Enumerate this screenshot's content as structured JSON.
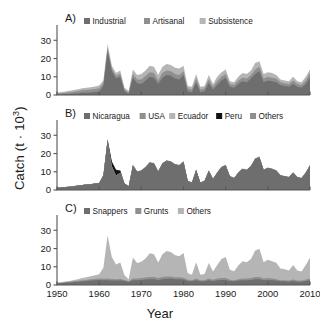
{
  "figure": {
    "axis_y_title": "Catch (t · 10",
    "axis_y_title_sup": "3",
    "axis_y_title_close": ")",
    "axis_x_title": "Year"
  },
  "colors": {
    "series_dark": "#6e6e6e",
    "series_mid": "#8f8f8f",
    "series_light": "#b5b5b5",
    "series_black": "#111111",
    "axis": "#555555",
    "background": "#ffffff",
    "text": "#1a1a1a"
  },
  "chart_data": [
    {
      "type": "area",
      "stacked": true,
      "panel": "A)",
      "title": "",
      "xlabel": "Year",
      "ylabel": "Catch (t · 10^3)",
      "xlim": [
        1950,
        2010
      ],
      "ylim": [
        0,
        34
      ],
      "xticks": [
        1950,
        1960,
        1970,
        1980,
        1990,
        2000,
        2010
      ],
      "yticks": [
        0,
        10,
        20,
        30
      ],
      "grid": false,
      "legend_position": "top",
      "legend": [
        "Industrial",
        "Artisanal",
        "Subsistence"
      ],
      "x": [
        1950,
        1951,
        1952,
        1953,
        1954,
        1955,
        1956,
        1957,
        1958,
        1959,
        1960,
        1961,
        1962,
        1963,
        1964,
        1965,
        1966,
        1967,
        1968,
        1969,
        1970,
        1971,
        1972,
        1973,
        1974,
        1975,
        1976,
        1977,
        1978,
        1979,
        1980,
        1981,
        1982,
        1983,
        1984,
        1985,
        1986,
        1987,
        1988,
        1989,
        1990,
        1991,
        1992,
        1993,
        1994,
        1995,
        1996,
        1997,
        1998,
        1999,
        2000,
        2001,
        2002,
        2003,
        2004,
        2005,
        2006,
        2007,
        2008,
        2009,
        2010
      ],
      "series": [
        {
          "name": "Industrial",
          "values": [
            0.3,
            0.4,
            0.5,
            0.6,
            0.8,
            1.0,
            1.2,
            1.3,
            1.4,
            1.6,
            1.8,
            5.0,
            24.0,
            13.0,
            9.0,
            10.0,
            2.0,
            0.6,
            9.5,
            6.5,
            6.0,
            8.0,
            10.0,
            9.5,
            6.0,
            9.5,
            11.0,
            10.5,
            9.0,
            8.5,
            11.0,
            2.0,
            1.5,
            7.0,
            1.5,
            2.0,
            6.5,
            3.0,
            5.5,
            8.0,
            9.5,
            4.5,
            4.0,
            6.0,
            7.5,
            7.0,
            9.0,
            11.5,
            13.0,
            7.0,
            8.0,
            7.5,
            7.0,
            5.5,
            5.0,
            4.5,
            6.0,
            4.5,
            4.0,
            6.0,
            9.5
          ]
        },
        {
          "name": "Artisanal",
          "values": [
            0.5,
            0.6,
            0.7,
            0.9,
            1.0,
            1.2,
            1.4,
            1.5,
            1.6,
            1.7,
            1.9,
            1.5,
            2.0,
            1.5,
            1.5,
            1.5,
            1.0,
            0.8,
            2.0,
            2.0,
            2.5,
            2.5,
            2.5,
            2.5,
            2.0,
            2.5,
            2.5,
            2.5,
            2.5,
            2.5,
            2.0,
            1.5,
            1.5,
            2.0,
            1.5,
            1.5,
            2.0,
            1.5,
            2.0,
            2.0,
            2.0,
            1.5,
            1.5,
            2.0,
            2.0,
            2.0,
            2.0,
            2.5,
            2.5,
            2.0,
            2.0,
            2.0,
            2.0,
            1.5,
            1.5,
            1.5,
            2.0,
            1.5,
            1.5,
            2.0,
            2.5
          ]
        },
        {
          "name": "Subsistence",
          "values": [
            0.5,
            0.6,
            0.7,
            0.8,
            0.9,
            1.0,
            1.1,
            1.2,
            1.3,
            1.4,
            1.5,
            1.5,
            2.0,
            1.5,
            1.5,
            2.0,
            1.0,
            0.8,
            2.5,
            2.5,
            3.0,
            3.0,
            3.5,
            3.5,
            3.0,
            3.5,
            3.5,
            3.5,
            3.5,
            3.5,
            3.0,
            1.5,
            1.5,
            2.5,
            1.5,
            1.5,
            2.5,
            1.5,
            2.5,
            2.5,
            2.5,
            1.5,
            1.5,
            2.0,
            2.5,
            2.5,
            2.5,
            3.5,
            3.0,
            2.5,
            2.5,
            2.5,
            2.0,
            1.5,
            1.5,
            1.5,
            2.0,
            1.5,
            1.5,
            2.0,
            2.0
          ]
        }
      ]
    },
    {
      "type": "area",
      "stacked": true,
      "panel": "B)",
      "title": "",
      "xlabel": "Year",
      "ylabel": "Catch (t · 10^3)",
      "xlim": [
        1950,
        2010
      ],
      "ylim": [
        0,
        34
      ],
      "xticks": [
        1950,
        1960,
        1970,
        1980,
        1990,
        2000,
        2010
      ],
      "yticks": [
        0,
        10,
        20,
        30
      ],
      "grid": false,
      "legend_position": "top",
      "legend": [
        "Nicaragua",
        "USA",
        "Ecuador",
        "Peru",
        "Others"
      ],
      "x": [
        1950,
        1951,
        1952,
        1953,
        1954,
        1955,
        1956,
        1957,
        1958,
        1959,
        1960,
        1961,
        1962,
        1963,
        1964,
        1965,
        1966,
        1967,
        1968,
        1969,
        1970,
        1971,
        1972,
        1973,
        1974,
        1975,
        1976,
        1977,
        1978,
        1979,
        1980,
        1981,
        1982,
        1983,
        1984,
        1985,
        1986,
        1987,
        1988,
        1989,
        1990,
        1991,
        1992,
        1993,
        1994,
        1995,
        1996,
        1997,
        1998,
        1999,
        2000,
        2001,
        2002,
        2003,
        2004,
        2005,
        2006,
        2007,
        2008,
        2009,
        2010
      ],
      "series": [
        {
          "name": "Nicaragua",
          "values": [
            1.2,
            1.4,
            1.6,
            1.8,
            2.1,
            2.4,
            2.7,
            3.0,
            3.2,
            3.5,
            3.8,
            8.0,
            27.0,
            13.0,
            8.0,
            9.5,
            3.5,
            2.0,
            13.5,
            10.0,
            10.5,
            12.5,
            15.0,
            14.5,
            10.0,
            14.5,
            16.0,
            15.5,
            14.0,
            13.5,
            15.5,
            5.0,
            4.0,
            11.0,
            4.0,
            5.0,
            10.5,
            6.0,
            9.5,
            12.5,
            13.5,
            7.5,
            6.5,
            9.5,
            11.5,
            11.0,
            13.0,
            17.0,
            18.0,
            11.0,
            12.0,
            11.5,
            10.5,
            8.0,
            7.5,
            7.0,
            9.5,
            7.0,
            6.5,
            9.5,
            13.5
          ]
        },
        {
          "name": "USA",
          "values": [
            0,
            0,
            0,
            0,
            0,
            0,
            0,
            0,
            0,
            0,
            0,
            0,
            0,
            0,
            0,
            0,
            0,
            0,
            0,
            0,
            0,
            0,
            0,
            0,
            0,
            0,
            0,
            0,
            0,
            0,
            0,
            0,
            0,
            0,
            0,
            0,
            0,
            0,
            0,
            0,
            0,
            0,
            0,
            0,
            0,
            0,
            0,
            0,
            0,
            0,
            0,
            0,
            0,
            0,
            0,
            0,
            0,
            0,
            0,
            0,
            0
          ]
        },
        {
          "name": "Ecuador",
          "values": [
            0,
            0,
            0,
            0,
            0,
            0,
            0,
            0,
            0,
            0,
            0,
            0,
            0,
            0,
            0,
            0,
            0,
            0,
            0,
            0,
            0,
            0,
            0,
            0,
            0,
            0,
            0,
            0,
            0,
            0,
            0,
            0,
            0,
            0,
            0,
            0,
            0,
            0,
            0,
            0,
            0,
            0,
            0,
            0,
            0,
            0,
            0,
            0,
            0,
            0,
            0,
            0,
            0,
            0,
            0,
            0,
            0,
            0,
            0,
            0,
            0
          ]
        },
        {
          "name": "Peru",
          "values": [
            0,
            0,
            0,
            0,
            0,
            0,
            0,
            0,
            0,
            0,
            0,
            0,
            0.5,
            2.5,
            3.0,
            1.0,
            0,
            0,
            0,
            0,
            0,
            0,
            0,
            0,
            0,
            0,
            0,
            0,
            0,
            0,
            0,
            0,
            0,
            0,
            0,
            0,
            0,
            0,
            0,
            0,
            0,
            0,
            0,
            0,
            0,
            0,
            0,
            0,
            0,
            0,
            0,
            0,
            0,
            0,
            0,
            0,
            0,
            0,
            0,
            0,
            0
          ]
        },
        {
          "name": "Others",
          "values": [
            0.1,
            0.1,
            0.1,
            0.1,
            0.1,
            0.1,
            0.1,
            0.1,
            0.1,
            0.1,
            0.1,
            0.2,
            0.5,
            0.3,
            0.3,
            0.3,
            0.2,
            0.1,
            0.3,
            0.3,
            0.3,
            0.3,
            0.3,
            0.3,
            0.3,
            0.3,
            0.3,
            0.3,
            0.3,
            0.3,
            0.3,
            0.2,
            0.2,
            0.3,
            0.2,
            0.2,
            0.3,
            0.2,
            0.3,
            0.3,
            0.3,
            0.2,
            0.2,
            0.3,
            0.3,
            0.3,
            0.3,
            0.4,
            0.4,
            0.3,
            0.3,
            0.3,
            0.3,
            0.2,
            0.2,
            0.2,
            0.3,
            0.2,
            0.2,
            0.3,
            0.4
          ]
        }
      ]
    },
    {
      "type": "area",
      "stacked": true,
      "panel": "C)",
      "title": "",
      "xlabel": "Year",
      "ylabel": "Catch (t · 10^3)",
      "xlim": [
        1950,
        2010
      ],
      "ylim": [
        0,
        34
      ],
      "xticks": [
        1950,
        1960,
        1970,
        1980,
        1990,
        2000,
        2010
      ],
      "yticks": [
        0,
        10,
        20,
        30
      ],
      "grid": false,
      "legend_position": "top",
      "legend": [
        "Snappers",
        "Grunts",
        "Others"
      ],
      "x": [
        1950,
        1951,
        1952,
        1953,
        1954,
        1955,
        1956,
        1957,
        1958,
        1959,
        1960,
        1961,
        1962,
        1963,
        1964,
        1965,
        1966,
        1967,
        1968,
        1969,
        1970,
        1971,
        1972,
        1973,
        1974,
        1975,
        1976,
        1977,
        1978,
        1979,
        1980,
        1981,
        1982,
        1983,
        1984,
        1985,
        1986,
        1987,
        1988,
        1989,
        1990,
        1991,
        1992,
        1993,
        1994,
        1995,
        1996,
        1997,
        1998,
        1999,
        2000,
        2001,
        2002,
        2003,
        2004,
        2005,
        2006,
        2007,
        2008,
        2009,
        2010
      ],
      "series": [
        {
          "name": "Snappers",
          "values": [
            0.9,
            1.0,
            1.2,
            1.4,
            1.6,
            1.8,
            2.0,
            2.2,
            2.4,
            2.6,
            2.8,
            2.6,
            2.6,
            2.4,
            2.4,
            2.4,
            2.2,
            1.6,
            2.6,
            2.6,
            2.8,
            3.0,
            3.2,
            3.2,
            2.8,
            3.2,
            3.4,
            3.4,
            3.2,
            3.2,
            3.0,
            2.2,
            2.0,
            2.6,
            2.0,
            2.0,
            2.6,
            2.2,
            2.6,
            2.8,
            2.8,
            2.2,
            2.0,
            2.4,
            2.6,
            2.6,
            2.8,
            3.2,
            3.2,
            2.6,
            2.8,
            2.6,
            2.4,
            2.0,
            2.0,
            1.8,
            2.2,
            1.8,
            1.8,
            2.2,
            2.6
          ]
        },
        {
          "name": "Grunts",
          "values": [
            0.3,
            0.3,
            0.4,
            0.4,
            0.5,
            0.5,
            0.6,
            0.6,
            0.7,
            0.7,
            0.8,
            0.8,
            1.0,
            0.9,
            0.8,
            0.9,
            0.6,
            0.5,
            1.0,
            0.9,
            1.0,
            1.1,
            1.2,
            1.2,
            1.0,
            1.2,
            1.2,
            1.2,
            1.1,
            1.1,
            1.0,
            0.7,
            0.6,
            0.9,
            0.6,
            0.6,
            0.9,
            0.7,
            0.9,
            1.0,
            1.0,
            0.7,
            0.6,
            0.8,
            0.9,
            0.9,
            1.0,
            1.2,
            1.2,
            0.9,
            1.0,
            0.9,
            0.8,
            0.6,
            0.6,
            0.6,
            0.8,
            0.6,
            0.6,
            0.8,
            0.9
          ]
        },
        {
          "name": "Others",
          "values": [
            0.1,
            0.2,
            0.3,
            0.4,
            0.6,
            0.9,
            1.2,
            1.5,
            1.7,
            2.0,
            2.3,
            6.0,
            23.5,
            12.0,
            8.0,
            9.0,
            2.5,
            1.0,
            11.5,
            8.5,
            9.0,
            10.5,
            13.0,
            12.5,
            8.5,
            12.5,
            14.0,
            13.5,
            12.0,
            11.5,
            13.5,
            3.5,
            3.0,
            9.0,
            3.0,
            3.5,
            8.5,
            4.5,
            7.5,
            10.5,
            11.5,
            5.5,
            5.0,
            7.5,
            9.5,
            9.0,
            10.5,
            14.5,
            15.5,
            9.0,
            10.0,
            9.5,
            9.0,
            6.5,
            6.0,
            5.5,
            8.0,
            5.5,
            5.0,
            8.0,
            11.5
          ]
        }
      ]
    }
  ]
}
